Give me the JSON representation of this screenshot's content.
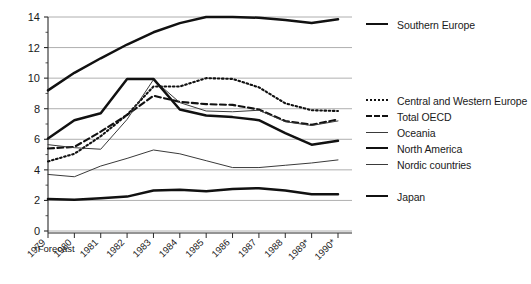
{
  "chart_data": {
    "type": "line",
    "title": "",
    "subtitle": "",
    "xlabel": "",
    "ylabel": "",
    "x": [
      "1979",
      "1980",
      "1981",
      "1982",
      "1983",
      "1984",
      "1985",
      "1986",
      "1987",
      "1988",
      "1989*",
      "1990*"
    ],
    "xtick_labels": [
      "1979",
      "1980",
      "1981",
      "1982",
      "1983",
      "1984",
      "1985",
      "1986",
      "1987",
      "1988",
      "1989*",
      "1990*"
    ],
    "ytick_labels": [
      "0",
      "2",
      "4",
      "6",
      "8",
      "10",
      "12",
      "14"
    ],
    "yticks": [
      0,
      2,
      4,
      6,
      8,
      10,
      12,
      14
    ],
    "ylim": [
      0,
      14
    ],
    "minor_tick_step": 1,
    "grid": "horizontal",
    "legend_position": "right",
    "annotations": [
      "*Forecast"
    ],
    "series": [
      {
        "name": "Southern Europe",
        "style": "solid-thick",
        "values": [
          9.2,
          10.35,
          11.3,
          12.2,
          13.0,
          13.6,
          14.0,
          14.0,
          13.95,
          13.8,
          13.6,
          13.85
        ]
      },
      {
        "name": "Central and Western Europe",
        "style": "dotted",
        "values": [
          4.55,
          5.05,
          6.2,
          7.6,
          9.45,
          9.45,
          10.0,
          9.95,
          9.4,
          8.35,
          7.9,
          7.85
        ]
      },
      {
        "name": "Total OECD",
        "style": "dashed",
        "values": [
          5.4,
          5.5,
          6.5,
          7.6,
          8.85,
          8.45,
          8.3,
          8.25,
          7.95,
          7.2,
          6.95,
          7.3
        ]
      },
      {
        "name": "Oceania",
        "style": "solid-thin",
        "values": [
          5.65,
          5.45,
          5.35,
          7.3,
          9.9,
          8.4,
          7.85,
          7.8,
          7.9,
          7.15,
          6.9,
          7.2
        ]
      },
      {
        "name": "North America",
        "style": "solid-thick",
        "values": [
          6.05,
          7.25,
          7.7,
          9.95,
          9.95,
          7.95,
          7.55,
          7.45,
          7.25,
          6.4,
          5.65,
          5.9
        ]
      },
      {
        "name": "Nordic countries",
        "style": "solid-thin",
        "values": [
          3.7,
          3.55,
          4.25,
          4.75,
          5.3,
          5.05,
          4.6,
          4.15,
          4.15,
          4.3,
          4.45,
          4.65
        ]
      },
      {
        "name": "Japan",
        "style": "solid-thick",
        "values": [
          2.1,
          2.05,
          2.15,
          2.25,
          2.65,
          2.7,
          2.6,
          2.75,
          2.8,
          2.65,
          2.4,
          2.4
        ]
      }
    ]
  },
  "legend": {
    "entries": [
      {
        "label": "Southern Europe",
        "style": "sw-thick"
      },
      {
        "label": "Central and Western Europe",
        "style": "sw-dotted"
      },
      {
        "label": "Total OECD",
        "style": "sw-dashed"
      },
      {
        "label": "Oceania",
        "style": "sw-thin"
      },
      {
        "label": "North America",
        "style": "sw-thick"
      },
      {
        "label": "Nordic countries",
        "style": "sw-thin"
      },
      {
        "label": "Japan",
        "style": "sw-thick"
      }
    ]
  },
  "footnote": {
    "text": "*Forecast"
  }
}
